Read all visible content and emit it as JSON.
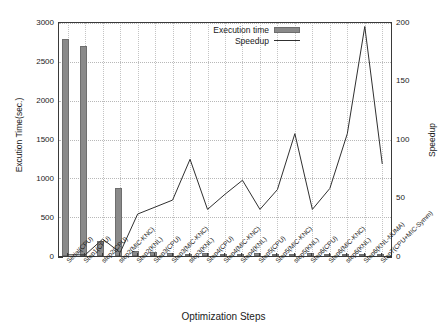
{
  "chart_data": {
    "type": "bar",
    "title": "",
    "xlabel": "Optimization Steps",
    "ylabel": "Excution Time(sec.)",
    "y2label": "Speedup",
    "ylim": [
      0,
      3000
    ],
    "y2lim": [
      0,
      200
    ],
    "yticks": [
      0,
      500,
      1000,
      1500,
      2000,
      2500,
      3000
    ],
    "y2ticks": [
      0,
      50,
      100,
      150,
      200
    ],
    "grid": true,
    "legend_position": "top-center",
    "categories": [
      "Serial(CPU)",
      "Step1(CPU)",
      "step2(CPU)",
      "step2(MIC-KNC)",
      "Step2(KNL)",
      "Step3(CPU)",
      "Step3(MIC-KNC)",
      "step3(KNL)",
      "Step4(CPU)",
      "Step4(MIC-KNC)",
      "Step4(KNL)",
      "Step5(CPU)",
      "Step5(MIC-KNC)",
      "step5(KNL)",
      "Step6(CPU)",
      "Step6(MIC-KNC)",
      "step6(KNL)",
      "Step6(KNL-NUMA)",
      "Step7(CPU+MIC-Symm)"
    ],
    "series": [
      {
        "name": "Execution time",
        "kind": "bar",
        "axis": "left",
        "color": "#8a8a8a",
        "values": [
          2800,
          2710,
          190,
          880,
          70,
          50,
          40,
          20,
          45,
          30,
          25,
          40,
          30,
          15,
          45,
          30,
          12,
          8,
          20
        ]
      },
      {
        "name": "Speedup",
        "kind": "line",
        "axis": "right",
        "color": "#303030",
        "values": [
          1,
          1,
          14.5,
          3,
          36,
          42,
          48,
          83,
          40,
          53,
          65,
          40,
          57,
          105,
          40,
          58,
          105,
          197,
          79
        ]
      }
    ]
  },
  "legend": {
    "entries": [
      {
        "label": "Execution time",
        "marker": "bar-swatch"
      },
      {
        "label": "Speedup",
        "marker": "line-swatch"
      }
    ]
  }
}
